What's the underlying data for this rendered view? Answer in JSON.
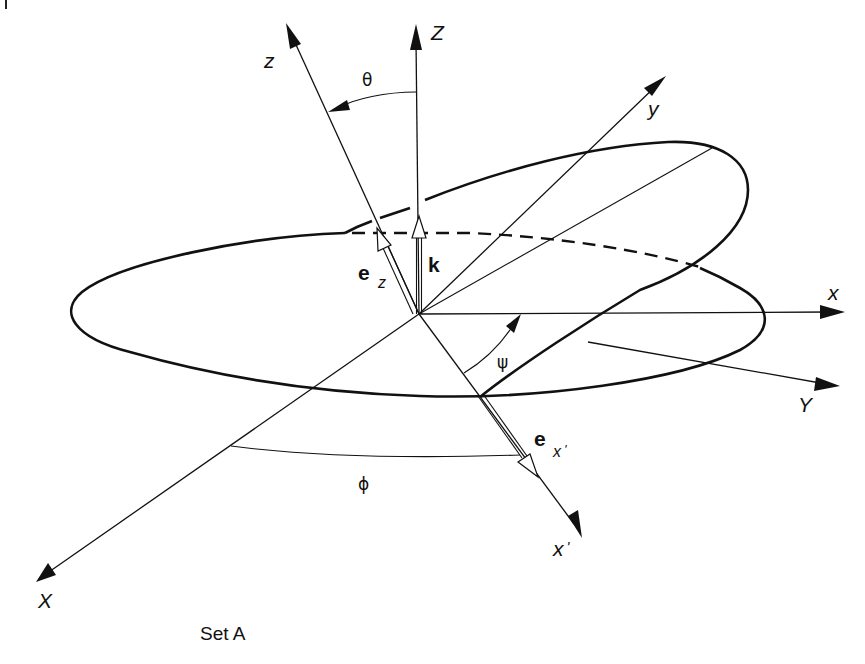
{
  "figure": {
    "caption": "Set A"
  },
  "axes": {
    "Z": {
      "label": "Z"
    },
    "z": {
      "label": "z"
    },
    "y": {
      "label": "y"
    },
    "x": {
      "label": "x"
    },
    "Y": {
      "label": "Y"
    },
    "X": {
      "label": "X"
    },
    "x_prime": {
      "label": "x",
      "prime": "'"
    }
  },
  "vectors": {
    "k": {
      "label": "k"
    },
    "e_z": {
      "label": "e",
      "subscript": "z"
    },
    "e_x_prime": {
      "label": "e",
      "subscript": "x",
      "prime": "'"
    }
  },
  "angles": {
    "theta": {
      "label": "θ"
    },
    "psi": {
      "label": "ψ"
    },
    "phi": {
      "label": "ϕ"
    }
  },
  "colors": {
    "ink": "#111111",
    "background": "#ffffff"
  }
}
